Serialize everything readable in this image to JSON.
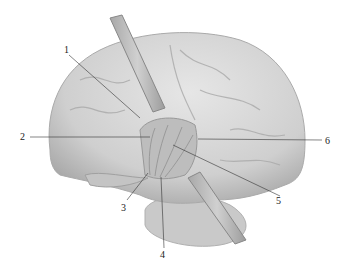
{
  "figure": {
    "labels": [
      {
        "id": "1",
        "text": "1",
        "x": 64,
        "y": 50,
        "line": [
          69,
          55,
          140,
          118
        ]
      },
      {
        "id": "2",
        "text": "2",
        "x": 20,
        "y": 134,
        "line": [
          30,
          137,
          150,
          137
        ]
      },
      {
        "id": "3",
        "text": "3",
        "x": 121,
        "y": 206,
        "line": [
          127,
          200,
          148,
          173
        ]
      },
      {
        "id": "4",
        "text": "4",
        "x": 160,
        "y": 254,
        "line": [
          164,
          248,
          161,
          177
        ]
      },
      {
        "id": "5",
        "text": "5",
        "x": 276,
        "y": 197,
        "line": [
          280,
          196,
          173,
          145
        ]
      },
      {
        "id": "6",
        "text": "6",
        "x": 325,
        "y": 137,
        "line": [
          322,
          140,
          198,
          139
        ]
      }
    ],
    "colors": {
      "brain": "#d6d6d6",
      "shadow": "#9a9a9a",
      "retractor": "#bdbdbd",
      "line": "#333333"
    }
  }
}
